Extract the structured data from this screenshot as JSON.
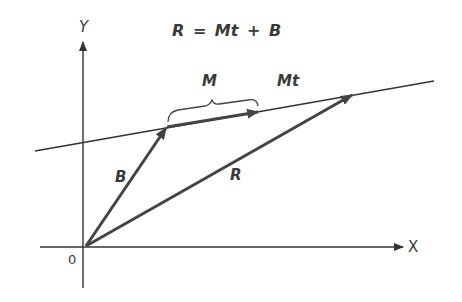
{
  "diagram": {
    "equation": "R = Mt + B",
    "labels": {
      "y_axis": "Y",
      "x_axis": "X",
      "origin": "0",
      "B": "B",
      "R": "R",
      "M": "M",
      "Mt": "Mt"
    },
    "colors": {
      "line": "#333333",
      "vector": "#444444"
    }
  }
}
